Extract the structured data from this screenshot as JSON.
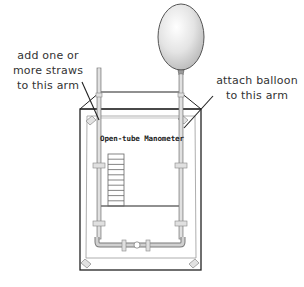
{
  "diagram": {
    "type": "apparatus-illustration",
    "device_title": "Open-tube Manometer",
    "annotations": [
      {
        "id": "left-arm",
        "lines": [
          "add one or",
          "more straws",
          "to this arm"
        ],
        "points_to": "left arm of manometer tube"
      },
      {
        "id": "right-arm",
        "lines": [
          "attach balloon",
          "to this arm"
        ],
        "points_to": "right arm of manometer tube"
      }
    ],
    "components": [
      "balloon",
      "left straw arm",
      "right arm",
      "U-tube",
      "scale ladder",
      "box board",
      "clips",
      "corner brackets"
    ],
    "scale_ticks": 10,
    "colors": {
      "line": "#222222",
      "tube": "#888888",
      "tube_fill": "#cfcfcf",
      "balloon_fill": "#e6e6e6",
      "balloon_stroke": "#555555",
      "text": "#333333"
    }
  }
}
